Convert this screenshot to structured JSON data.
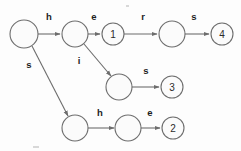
{
  "diagram": {
    "background_color": "#fdfdfd",
    "stroke_color": "#6d6d6d",
    "label_color": "#1e1e1e",
    "nodes": [
      {
        "id": "root",
        "label": "",
        "cx": 24,
        "cy": 34,
        "r": 14,
        "name": "node-root"
      },
      {
        "id": "n_h",
        "label": "",
        "cx": 75,
        "cy": 34,
        "r": 13,
        "name": "node-h"
      },
      {
        "id": "n1",
        "label": "1",
        "cx": 113,
        "cy": 34,
        "r": 11,
        "name": "node-1"
      },
      {
        "id": "n_her",
        "label": "",
        "cx": 172,
        "cy": 34,
        "r": 13,
        "name": "node-her"
      },
      {
        "id": "n4",
        "label": "4",
        "cx": 222,
        "cy": 34,
        "r": 11,
        "name": "node-4"
      },
      {
        "id": "n_hi",
        "label": "",
        "cx": 119,
        "cy": 87,
        "r": 13,
        "name": "node-hi"
      },
      {
        "id": "n3",
        "label": "3",
        "cx": 172,
        "cy": 87,
        "r": 11,
        "name": "node-3"
      },
      {
        "id": "n_s",
        "label": "",
        "cx": 75,
        "cy": 128,
        "r": 13,
        "name": "node-s"
      },
      {
        "id": "n_sh",
        "label": "",
        "cx": 128,
        "cy": 128,
        "r": 13,
        "name": "node-sh"
      },
      {
        "id": "n2",
        "label": "2",
        "cx": 173,
        "cy": 128,
        "r": 11,
        "name": "node-2"
      }
    ],
    "edges": [
      {
        "id": "e_h",
        "from": "root",
        "to": "n_h",
        "label": "h",
        "lx": 49,
        "ly": 16,
        "name": "edge-root-h"
      },
      {
        "id": "e_e",
        "from": "n_h",
        "to": "n1",
        "label": "e",
        "lx": 94,
        "ly": 16,
        "name": "edge-h-e"
      },
      {
        "id": "e_r",
        "from": "n1",
        "to": "n_her",
        "label": "r",
        "lx": 143,
        "ly": 16,
        "name": "edge-1-r"
      },
      {
        "id": "e_s4",
        "from": "n_her",
        "to": "n4",
        "label": "s",
        "lx": 194,
        "ly": 16,
        "name": "edge-her-s"
      },
      {
        "id": "e_i",
        "from": "n_h",
        "to": "n_hi",
        "label": "i",
        "lx": 79,
        "ly": 60,
        "name": "edge-h-i"
      },
      {
        "id": "e_s3",
        "from": "n_hi",
        "to": "n3",
        "label": "s",
        "lx": 146,
        "ly": 70,
        "name": "edge-hi-s"
      },
      {
        "id": "e_s",
        "from": "root",
        "to": "n_s",
        "label": "s",
        "lx": 29,
        "ly": 64,
        "name": "edge-root-s"
      },
      {
        "id": "e_h2",
        "from": "n_s",
        "to": "n_sh",
        "label": "h",
        "lx": 100,
        "ly": 112,
        "name": "edge-s-h"
      },
      {
        "id": "e_e2",
        "from": "n_sh",
        "to": "n2",
        "label": "e",
        "lx": 150,
        "ly": 112,
        "name": "edge-sh-e"
      }
    ],
    "accepting_states": [
      "1",
      "2",
      "3",
      "4"
    ]
  }
}
